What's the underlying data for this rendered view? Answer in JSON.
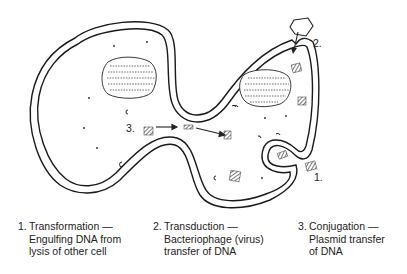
{
  "figure": {
    "labels": {
      "transformation_marker": "1.",
      "transduction_marker": "2.",
      "conjugation_marker": "3."
    }
  },
  "captions": [
    {
      "number": "1.",
      "lines": [
        "Transformation —",
        "Engulfing DNA from",
        "lysis of other cell"
      ]
    },
    {
      "number": "2.",
      "lines": [
        "Transduction —",
        "Bacteriophage (virus)",
        "transfer of DNA"
      ]
    },
    {
      "number": "3.",
      "lines": [
        "Conjugation —",
        "Plasmid transfer",
        "of DNA"
      ]
    }
  ],
  "colors": {
    "line": "#1a1a1a",
    "background": "#ffffff"
  }
}
